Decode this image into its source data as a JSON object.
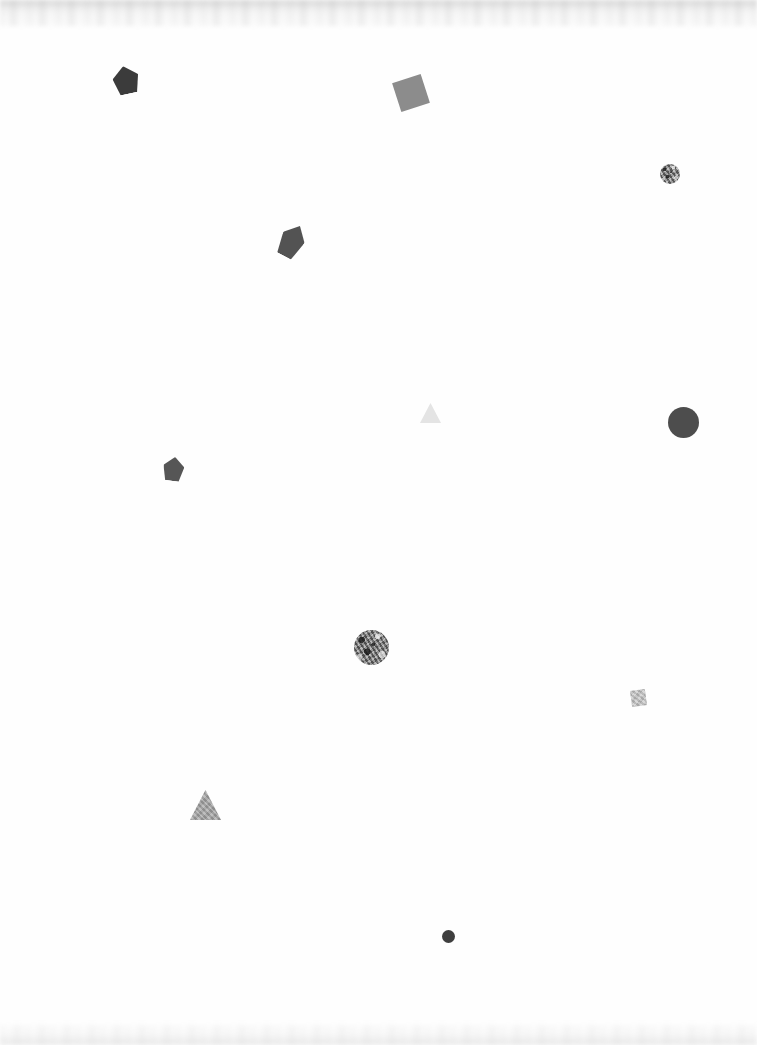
{
  "canvas": {
    "width": 757,
    "height": 1045,
    "background_color": "#fefefe",
    "description": "Sparse grayscale geometric shape scatter on near-white background",
    "edge_artifact_top": "faint blurred gray band",
    "edge_artifact_bottom": "faint blurred gray band"
  },
  "shapes": [
    {
      "id": "shape-1",
      "kind": "pentagon",
      "name": "pentagon-dark-top-left",
      "x": 113,
      "y": 66,
      "width": 26,
      "height": 28,
      "rotation": -12,
      "color": "#3b3b3b",
      "texture": "solid",
      "opacity": 1
    },
    {
      "id": "shape-2",
      "kind": "square",
      "name": "square-gray-top-center",
      "x": 396,
      "y": 78,
      "width": 30,
      "height": 30,
      "rotation": -18,
      "color": "#8c8c8c",
      "texture": "solid",
      "opacity": 1
    },
    {
      "id": "shape-3",
      "kind": "circle",
      "name": "circle-textured-top-right",
      "x": 660,
      "y": 164,
      "width": 20,
      "height": 20,
      "rotation": 0,
      "color": "#9a9a9a",
      "texture": "noise",
      "opacity": 1
    },
    {
      "id": "shape-4",
      "kind": "pentagon",
      "name": "pentagon-dark-upper-center",
      "x": 280,
      "y": 224,
      "width": 24,
      "height": 34,
      "rotation": 28,
      "color": "#535353",
      "texture": "solid",
      "opacity": 1
    },
    {
      "id": "shape-5",
      "kind": "triangle",
      "name": "triangle-pale-center",
      "x": 420,
      "y": 403,
      "width": 21,
      "height": 20,
      "rotation": 0,
      "color": "#e4e4e4",
      "texture": "solid",
      "opacity": 1
    },
    {
      "id": "shape-6",
      "kind": "circle",
      "name": "circle-dark-large-right",
      "x": 668,
      "y": 407,
      "width": 31,
      "height": 31,
      "rotation": 0,
      "color": "#4d4d4d",
      "texture": "solid",
      "opacity": 1
    },
    {
      "id": "shape-7",
      "kind": "pentagon",
      "name": "pentagon-dark-mid-left",
      "x": 163,
      "y": 457,
      "width": 21,
      "height": 24,
      "rotation": 8,
      "color": "#565656",
      "texture": "solid",
      "opacity": 1
    },
    {
      "id": "shape-8",
      "kind": "circle",
      "name": "circle-textured-center",
      "x": 354,
      "y": 630,
      "width": 35,
      "height": 35,
      "rotation": 0,
      "color": "#8f8f8f",
      "texture": "noise",
      "opacity": 1
    },
    {
      "id": "shape-9",
      "kind": "square",
      "name": "square-light-lower-right",
      "x": 631,
      "y": 690,
      "width": 15,
      "height": 16,
      "rotation": -8,
      "color": "#c9c9c9",
      "texture": "light-noise",
      "opacity": 1
    },
    {
      "id": "shape-10",
      "kind": "triangle",
      "name": "triangle-gray-lower-left",
      "x": 190,
      "y": 790,
      "width": 31,
      "height": 30,
      "rotation": 0,
      "color": "#a9a9a9",
      "texture": "light-noise",
      "opacity": 1
    },
    {
      "id": "shape-11",
      "kind": "circle",
      "name": "circle-dark-small-bottom",
      "x": 442,
      "y": 930,
      "width": 13,
      "height": 13,
      "rotation": 0,
      "color": "#3e3e3e",
      "texture": "solid",
      "opacity": 1
    }
  ],
  "counts": {
    "total": 11,
    "pentagons": 3,
    "squares": 2,
    "circles": 4,
    "triangles": 2
  }
}
